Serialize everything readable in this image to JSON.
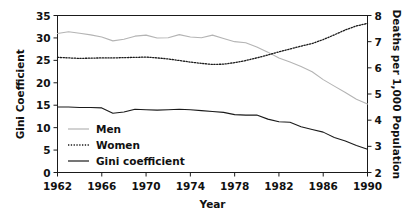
{
  "chart_data": {
    "type": "line",
    "title": "",
    "xlabel": "Year",
    "ylabel": "Gini Coefficient",
    "ylabel_right": "Deaths per 1,000 Population",
    "xlim": [
      1962,
      1990
    ],
    "ylim": [
      0,
      35
    ],
    "ylim_right": [
      2,
      8
    ],
    "xticks": [
      1962,
      1966,
      1970,
      1974,
      1978,
      1982,
      1986,
      1990
    ],
    "xtick_labels": [
      "1962",
      "1966",
      "1970",
      "1974",
      "1978",
      "1982",
      "1986",
      "1990"
    ],
    "yticks": [
      0,
      5,
      10,
      15,
      20,
      25,
      30,
      35
    ],
    "ytick_labels": [
      "0",
      "5",
      "10",
      "15",
      "20",
      "25",
      "30",
      "35"
    ],
    "yticks_right": [
      2,
      3,
      4,
      5,
      6,
      7,
      8
    ],
    "ytick_labels_right": [
      "2",
      "3",
      "4",
      "5",
      "6",
      "7",
      "8"
    ],
    "grid": false,
    "legend_position": "lower-left-inside",
    "x": [
      1962,
      1963,
      1964,
      1965,
      1966,
      1967,
      1968,
      1969,
      1970,
      1971,
      1972,
      1973,
      1974,
      1975,
      1976,
      1977,
      1978,
      1979,
      1980,
      1981,
      1982,
      1983,
      1984,
      1985,
      1986,
      1987,
      1988,
      1989,
      1990
    ],
    "series": [
      {
        "name": "Men",
        "axis": "right",
        "color": "#b4b4b4",
        "style": "solid",
        "units": "Deaths per 1,000 Population",
        "values": [
          7.31,
          7.38,
          7.32,
          7.26,
          7.18,
          7.03,
          7.09,
          7.21,
          7.25,
          7.14,
          7.15,
          7.27,
          7.18,
          7.15,
          7.25,
          7.12,
          7.0,
          6.96,
          6.8,
          6.6,
          6.38,
          6.22,
          6.05,
          5.85,
          5.55,
          5.3,
          5.06,
          4.8,
          4.62
        ],
        "values_left_scale": [
          31.1,
          31.7,
          31.2,
          30.8,
          30.1,
          29.0,
          29.4,
          30.3,
          30.5,
          29.8,
          29.9,
          30.8,
          30.1,
          29.9,
          30.7,
          29.8,
          28.9,
          28.6,
          27.6,
          26.4,
          25.1,
          24.2,
          23.2,
          22.0,
          20.5,
          19.2,
          17.7,
          16.4,
          15.8
        ]
      },
      {
        "name": "Women",
        "axis": "right",
        "color": "#1a1a1a",
        "style": "dotted",
        "units": "Deaths per 1,000 Population",
        "values": [
          6.4,
          6.38,
          6.36,
          6.37,
          6.38,
          6.38,
          6.39,
          6.4,
          6.41,
          6.38,
          6.34,
          6.28,
          6.22,
          6.17,
          6.13,
          6.14,
          6.2,
          6.28,
          6.38,
          6.49,
          6.61,
          6.72,
          6.83,
          6.93,
          7.08,
          7.26,
          7.45,
          7.6,
          7.7
        ],
        "values_left_scale": [
          25.7,
          25.5,
          25.4,
          25.5,
          25.6,
          25.6,
          25.6,
          25.7,
          25.8,
          25.5,
          25.3,
          25.0,
          24.6,
          24.3,
          24.1,
          24.1,
          24.5,
          25.0,
          25.6,
          26.2,
          26.9,
          27.5,
          28.2,
          28.8,
          29.6,
          30.7,
          31.7,
          32.6,
          33.1
        ]
      },
      {
        "name": "Gini coefficient",
        "axis": "left",
        "color": "#1a1a1a",
        "style": "solid",
        "units": "Gini Coefficient",
        "values": [
          14.6,
          14.6,
          14.5,
          14.5,
          14.4,
          13.2,
          13.5,
          14.1,
          14.0,
          13.9,
          14.0,
          14.1,
          14.0,
          13.8,
          13.6,
          13.4,
          12.9,
          12.8,
          12.8,
          11.9,
          11.3,
          11.2,
          10.2,
          9.6,
          9.0,
          7.8,
          7.0,
          6.0,
          5.2
        ]
      }
    ]
  },
  "legend": {
    "items": [
      {
        "label": "Men",
        "style": "solid",
        "color": "#b4b4b4"
      },
      {
        "label": "Women",
        "style": "dotted",
        "color": "#1a1a1a"
      },
      {
        "label": "Gini coefficient",
        "style": "solid",
        "color": "#1a1a1a"
      }
    ]
  }
}
